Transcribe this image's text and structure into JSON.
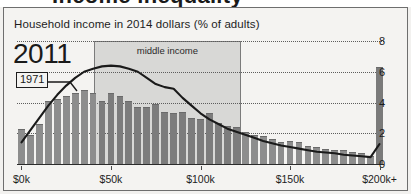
{
  "headline_fragment": "Income inequality",
  "chart": {
    "title": "Household income in 2014 dollars (% of adults)",
    "year_current_label": "2011",
    "year_compare_label": "1971",
    "band_label": "middle income"
  },
  "chart_data": {
    "type": "bar",
    "title": "Household income in 2014 dollars (% of adults)",
    "xlabel": "",
    "ylabel": "% of adults",
    "ylim": [
      0,
      8
    ],
    "xlim": [
      0,
      205
    ],
    "grid": true,
    "legend": "annotations",
    "yticks": [
      "0",
      "2",
      "4",
      "6",
      "8"
    ],
    "ytick_values": [
      0,
      2,
      4,
      6,
      8
    ],
    "xticks": [
      "$0k",
      "$50k",
      "$100k",
      "$150k",
      "$200k+"
    ],
    "xtick_values": [
      0,
      50,
      100,
      150,
      200
    ],
    "bin_width_k": 5,
    "annotations": [
      {
        "text": "2011",
        "role": "bar-series-label"
      },
      {
        "text": "1971",
        "role": "line-series-label"
      },
      {
        "text": "middle income",
        "role": "band-label",
        "x_start_k": 43,
        "x_end_k": 125
      }
    ],
    "categories": [
      "$0-5k",
      "$5-10k",
      "$10-15k",
      "$15-20k",
      "$20-25k",
      "$25-30k",
      "$30-35k",
      "$35-40k",
      "$40-45k",
      "$45-50k",
      "$50-55k",
      "$55-60k",
      "$60-65k",
      "$65-70k",
      "$70-75k",
      "$75-80k",
      "$80-85k",
      "$85-90k",
      "$90-95k",
      "$95-100k",
      "$100-105k",
      "$105-110k",
      "$110-115k",
      "$115-120k",
      "$120-125k",
      "$125-130k",
      "$130-135k",
      "$135-140k",
      "$140-145k",
      "$145-150k",
      "$150-155k",
      "$155-160k",
      "$160-165k",
      "$165-170k",
      "$170-175k",
      "$175-180k",
      "$180-185k",
      "$185-190k",
      "$190-195k",
      "$195-200k",
      "$200k+"
    ],
    "series": [
      {
        "name": "2011",
        "type": "bar",
        "values": [
          2.3,
          1.9,
          2.6,
          4.1,
          4.2,
          4.4,
          4.6,
          4.8,
          4.6,
          4.1,
          4.6,
          4.4,
          4.1,
          3.7,
          3.7,
          3.9,
          3.4,
          3.3,
          3.4,
          3.0,
          2.9,
          3.3,
          2.7,
          2.5,
          2.4,
          2.1,
          1.9,
          1.8,
          1.6,
          1.4,
          1.5,
          1.4,
          1.2,
          1.1,
          1.0,
          0.9,
          0.9,
          0.8,
          0.7,
          0.5,
          6.3
        ]
      },
      {
        "name": "1971",
        "type": "line",
        "values": [
          1.4,
          2.2,
          3.0,
          3.8,
          4.5,
          5.1,
          5.6,
          6.0,
          6.2,
          6.35,
          6.4,
          6.35,
          6.2,
          6.0,
          5.6,
          5.2,
          5.0,
          4.9,
          4.3,
          3.8,
          3.3,
          2.9,
          2.6,
          2.3,
          2.1,
          1.9,
          1.7,
          1.5,
          1.35,
          1.2,
          1.1,
          1.0,
          0.9,
          0.8,
          0.75,
          0.7,
          0.6,
          0.55,
          0.5,
          0.45,
          1.3
        ]
      }
    ]
  }
}
